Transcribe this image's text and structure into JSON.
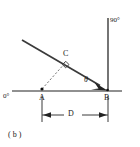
{
  "figure": {
    "caption": "( b )",
    "caption_letter": "b",
    "labels": {
      "zero_degrees": "0°",
      "ninety_degrees": "90°",
      "point_a": "A",
      "point_b": "B",
      "point_c": "C",
      "angle_theta": "θ",
      "dimension_d": "D"
    },
    "colors": {
      "line": "#3a3a3a",
      "baseline": "#6b6b6b",
      "text": "#1a1a1a",
      "background": "#ffffff"
    },
    "geometry": {
      "baseline": {
        "x1": 12,
        "y1": 91,
        "x2": 122,
        "y2": 91
      },
      "vertical_axis": {
        "x1": 108,
        "y1": 18,
        "x2": 108,
        "y2": 91
      },
      "ray_to_b": {
        "x1": 22,
        "y1": 40,
        "x2": 106,
        "y2": 89
      },
      "dashed_a_to_c": {
        "x1": 42,
        "y1": 89,
        "x2": 66,
        "y2": 62
      },
      "dimension_line": {
        "x1": 42,
        "y1": 115,
        "x2": 108,
        "y2": 115
      },
      "point_a": {
        "x": 42,
        "y": 89
      },
      "point_b": {
        "x": 108,
        "y": 91
      },
      "point_c": {
        "x": 66,
        "y": 62
      },
      "right_angle_at": "C",
      "arrowhead_at": "B"
    }
  }
}
